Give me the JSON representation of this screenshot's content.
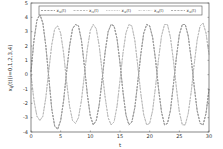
{
  "chart_data": {
    "type": "line",
    "title": "",
    "xlabel": "t",
    "ylabel": "x_{ij}(t)(i=0,1,2,3,4)",
    "xlim": [
      0,
      30
    ],
    "ylim": [
      -4,
      5
    ],
    "xticks": [
      0,
      5,
      10,
      15,
      20,
      25,
      30
    ],
    "yticks": [
      -4,
      -3,
      -2,
      -1,
      0,
      1,
      2,
      3,
      4,
      5
    ],
    "grid": false,
    "legend_position": "top (horizontal, inside)",
    "legend": [
      "x_{i0}(t)",
      "x_{i1}(t)",
      "x_{i2}(t)",
      "x_{i3}(t)",
      "x_{i4}(t)"
    ],
    "series": [
      {
        "name": "x_{i0}(t)",
        "style": "dashed",
        "color": "#8a8a8a",
        "x": [
          0,
          0.5,
          1,
          1.5,
          2,
          2.5,
          3,
          3.5,
          4,
          4.5,
          5,
          5.5,
          6,
          6.5,
          7,
          7.5,
          8,
          8.5,
          9,
          9.5,
          10,
          10.5,
          11,
          11.5,
          12,
          12.5,
          13,
          13.5,
          14,
          14.5,
          15,
          15.5,
          16,
          16.5,
          17,
          17.5,
          18,
          18.5,
          19,
          19.5,
          20,
          20.5,
          21,
          21.5,
          22,
          22.5,
          23,
          23.5,
          24,
          24.5,
          25,
          25.5,
          26,
          26.5,
          27,
          27.5,
          28,
          28.5,
          29,
          29.5,
          30
        ],
        "values": [
          0.2,
          2.4,
          3.8,
          4.2,
          3.6,
          2.0,
          -0.2,
          -2.4,
          -3.6,
          -3.8,
          -3.2,
          -1.8,
          0.2,
          2.0,
          3.2,
          3.5,
          3.4,
          2.4,
          0.6,
          -1.4,
          -2.9,
          -3.5,
          -3.2,
          -2.1,
          -0.3,
          1.6,
          3.0,
          3.5,
          3.4,
          2.5,
          0.8,
          -1.2,
          -2.8,
          -3.5,
          -3.3,
          -2.3,
          -0.5,
          1.4,
          2.9,
          3.5,
          3.4,
          2.6,
          1.0,
          -1.0,
          -2.6,
          -3.5,
          -3.4,
          -2.5,
          -0.7,
          1.2,
          2.8,
          3.5,
          3.5,
          2.7,
          1.1,
          -0.8,
          -2.5,
          -3.4,
          -3.5,
          -2.7,
          -1.0
        ]
      },
      {
        "name": "x_{i1}(t)",
        "style": "dashed",
        "color": "#a8a8a8",
        "x": [
          0,
          0.5,
          1,
          1.5,
          2,
          2.5,
          3,
          3.5,
          4,
          4.5,
          5,
          5.5,
          6,
          6.5,
          7,
          7.5,
          8,
          8.5,
          9,
          9.5,
          10,
          10.5,
          11,
          11.5,
          12,
          12.5,
          13,
          13.5,
          14,
          14.5,
          15,
          15.5,
          16,
          16.5,
          17,
          17.5,
          18,
          18.5,
          19,
          19.5,
          20,
          20.5,
          21,
          21.5,
          22,
          22.5,
          23,
          23.5,
          24,
          24.5,
          25,
          25.5,
          26,
          26.5,
          27,
          27.5,
          28,
          28.5,
          29,
          29.5,
          30
        ],
        "values": [
          0.0,
          -1.8,
          -2.9,
          -3.2,
          -2.9,
          -1.6,
          0.3,
          2.1,
          3.2,
          3.4,
          2.9,
          1.5,
          -0.5,
          -2.2,
          -3.2,
          -3.4,
          -3.0,
          -1.8,
          0.0,
          1.8,
          3.1,
          3.5,
          3.2,
          2.0,
          0.2,
          -1.6,
          -3.0,
          -3.5,
          -3.3,
          -2.2,
          -0.4,
          1.5,
          2.9,
          3.5,
          3.4,
          2.4,
          0.6,
          -1.3,
          -2.8,
          -3.5,
          -3.4,
          -2.5,
          -0.8,
          1.1,
          2.7,
          3.5,
          3.5,
          2.6,
          1.0,
          -0.9,
          -2.6,
          -3.5,
          -3.5,
          -2.7,
          -1.2,
          0.7,
          2.4,
          3.4,
          3.6,
          2.9,
          1.4
        ]
      },
      {
        "name": "x_{i2}(t)",
        "style": "dotted",
        "color": "#b5b5b5",
        "values_same_as": "x_{i0}(t)"
      },
      {
        "name": "x_{i3}(t)",
        "style": "dash-dot",
        "color": "#c0c0c0",
        "values_same_as": "x_{i1}(t)"
      },
      {
        "name": "x_{i4}(t)",
        "style": "dashed",
        "color": "#9a9a9a",
        "values_same_as": "x_{i0}(t)"
      }
    ]
  }
}
